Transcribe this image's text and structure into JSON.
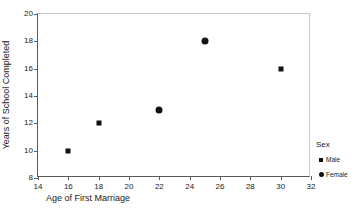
{
  "chart_data": {
    "type": "scatter",
    "title": "",
    "xlabel": "Age of First Marriage",
    "ylabel": "Years of School Completed",
    "xlim": [
      14,
      32
    ],
    "ylim": [
      8,
      20
    ],
    "xticks": [
      14,
      16,
      18,
      20,
      22,
      24,
      26,
      28,
      30,
      32
    ],
    "yticks": [
      8,
      10,
      12,
      14,
      16,
      18,
      20
    ],
    "grid": false,
    "legend_position": "right",
    "legend_title": "Sex",
    "series": [
      {
        "name": "Male",
        "marker": "square",
        "color": "#111111",
        "points": [
          {
            "x": 16,
            "y": 10
          },
          {
            "x": 18,
            "y": 12
          },
          {
            "x": 30,
            "y": 16
          }
        ]
      },
      {
        "name": "Female",
        "marker": "circle",
        "color": "#111111",
        "points": [
          {
            "x": 22,
            "y": 13
          },
          {
            "x": 25,
            "y": 18
          }
        ]
      }
    ]
  }
}
